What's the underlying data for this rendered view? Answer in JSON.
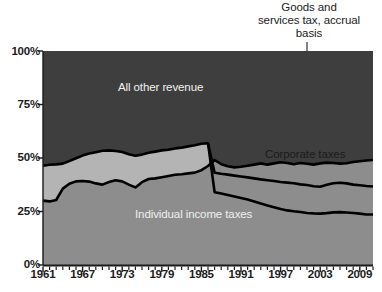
{
  "chart_data": {
    "type": "area",
    "stacked": true,
    "normalized_percent": true,
    "title": "",
    "subtitle": "",
    "xlabel": "",
    "ylabel": "",
    "xlim": [
      1961,
      2011
    ],
    "ylim": [
      0,
      100
    ],
    "grid": false,
    "legend_position": "inline-labels",
    "y_ticks": [
      "0%",
      "25%",
      "50%",
      "75%",
      "100%"
    ],
    "y_tick_values": [
      0,
      25,
      50,
      75,
      100
    ],
    "x_ticks": [
      "1961",
      "1967",
      "1973",
      "1979",
      "1985",
      "1991",
      "1997",
      "2003",
      "2009"
    ],
    "x_tick_values": [
      1961,
      1967,
      1973,
      1979,
      1985,
      1991,
      1997,
      2003,
      2009
    ],
    "x_minor_tick_interval": 1,
    "annotations": [
      {
        "name": "gst-annotation",
        "lines": [
          "Goods and",
          "services tax, accrual",
          "basis"
        ],
        "text": "Goods and services tax, accrual basis",
        "leader_line": true,
        "points_to_year": 2003
      }
    ],
    "series": [
      {
        "name": "Individual income taxes",
        "label": "Individual income taxes",
        "color": "#8d8d8d",
        "label_color": "#efefef",
        "stack_order": 1,
        "x": [
          1961,
          1962,
          1963,
          1964,
          1965,
          1966,
          1967,
          1968,
          1969,
          1970,
          1971,
          1972,
          1973,
          1974,
          1975,
          1976,
          1977,
          1978,
          1979,
          1980,
          1981,
          1982,
          1983,
          1984,
          1985,
          1986,
          1987,
          1988,
          1989,
          1990,
          1991,
          1992,
          1993,
          1994,
          1995,
          1996,
          1997,
          1998,
          1999,
          2000,
          2001,
          2002,
          2003,
          2004,
          2005,
          2006,
          2007,
          2008,
          2009,
          2010,
          2011
        ],
        "values": [
          30.5,
          29.5,
          29.3,
          29.6,
          30.0,
          29.8,
          29.6,
          32.0,
          36.0,
          39.5,
          41.5,
          42.0,
          42.3,
          41.0,
          39.0,
          40.3,
          41.8,
          41.5,
          40.5,
          38.0,
          39.5,
          40.5,
          41.0,
          39.0,
          36.2,
          39.5,
          40.5,
          41.0,
          42.0,
          43.0,
          45.5,
          48.0,
          46.0,
          45.3,
          45.2,
          45.5,
          45.3,
          45.0,
          46.3,
          45.5,
          47.0,
          46.0,
          45.3,
          46.5,
          45.5,
          45.8,
          46.0,
          47.5,
          47.5,
          48.5,
          49.0
        ]
      },
      {
        "name": "Corporate taxes",
        "label": "Corporate taxes",
        "color": "#b4b4b4",
        "label_color": "#1b1b1b",
        "stack_order": 2,
        "x": [
          1961,
          1962,
          1963,
          1964,
          1965,
          1966,
          1967,
          1968,
          1969,
          1970,
          1971,
          1972,
          1973,
          1974,
          1975,
          1976,
          1977,
          1978,
          1979,
          1980,
          1981,
          1982,
          1983,
          1984,
          1985,
          1986,
          1987,
          1988,
          1989,
          1990,
          1991,
          1992,
          1993,
          1994,
          1995,
          1996,
          1997,
          1998,
          1999,
          2000,
          2001,
          2002,
          2003,
          2004,
          2005,
          2006,
          2007,
          2008,
          2009,
          2010,
          2011
        ],
        "values": [
          20.5,
          19.3,
          19.0,
          18.6,
          18.3,
          18.4,
          18.0,
          19.5,
          17.7,
          16.5,
          15.0,
          15.3,
          16.2,
          17.5,
          18.0,
          16.0,
          14.5,
          14.5,
          15.8,
          18.0,
          16.3,
          14.5,
          14.0,
          16.5,
          18.5,
          14.5,
          14.0,
          14.5,
          13.8,
          13.0,
          11.5,
          6.0,
          7.3,
          8.5,
          9.0,
          9.5,
          10.5,
          11.5,
          11.3,
          13.0,
          12.8,
          13.5,
          12.5,
          12.2,
          14.5,
          15.5,
          15.2,
          13.5,
          13.0,
          13.3,
          13.2
        ]
      },
      {
        "name": "Goods and services tax, accrual basis",
        "label": "",
        "color": "#e7e7e7",
        "stack_order": 3,
        "note": "Band appears beginning 1991; zero before that.",
        "x": [
          1961,
          1962,
          1963,
          1964,
          1965,
          1966,
          1967,
          1968,
          1969,
          1970,
          1971,
          1972,
          1973,
          1974,
          1975,
          1976,
          1977,
          1978,
          1979,
          1980,
          1981,
          1982,
          1983,
          1984,
          1985,
          1986,
          1987,
          1988,
          1989,
          1990,
          1991,
          1992,
          1993,
          1994,
          1995,
          1996,
          1997,
          1998,
          1999,
          2000,
          2001,
          2002,
          2003,
          2004,
          2005,
          2006,
          2007,
          2008,
          2009,
          2010,
          2011
        ],
        "values": [
          0,
          0,
          0,
          0,
          0,
          0,
          0,
          0,
          0,
          0,
          0,
          0,
          0,
          0,
          0,
          0,
          0,
          0,
          0,
          0,
          0,
          0,
          0,
          0,
          0,
          0,
          0,
          0,
          0,
          0,
          0,
          14.5,
          14.2,
          14.0,
          13.8,
          13.7,
          13.5,
          13.3,
          13.8,
          14.2,
          14.0,
          14.2,
          15.0,
          14.8,
          13.7,
          13.2,
          13.5,
          14.5,
          14.8,
          14.0,
          13.8
        ]
      },
      {
        "name": "All other revenue",
        "label": "All other revenue",
        "color": "#3e3e3e",
        "label_color": "#f2f2f2",
        "stack_order": 4,
        "x": [
          1961,
          1962,
          1963,
          1964,
          1965,
          1966,
          1967,
          1968,
          1969,
          1970,
          1971,
          1972,
          1973,
          1974,
          1975,
          1976,
          1977,
          1978,
          1979,
          1980,
          1981,
          1982,
          1983,
          1984,
          1985,
          1986,
          1987,
          1988,
          1989,
          1990,
          1991,
          1992,
          1993,
          1994,
          1995,
          1996,
          1997,
          1998,
          1999,
          2000,
          2001,
          2002,
          2003,
          2004,
          2005,
          2006,
          2007,
          2008,
          2009,
          2010,
          2011
        ],
        "values": [
          49.0,
          51.2,
          51.7,
          51.8,
          51.7,
          51.8,
          52.4,
          48.5,
          46.3,
          44.0,
          43.5,
          42.7,
          41.5,
          41.5,
          43.0,
          43.7,
          43.7,
          44.0,
          43.7,
          44.0,
          44.2,
          45.0,
          45.0,
          44.5,
          45.3,
          46.0,
          45.5,
          44.5,
          44.2,
          44.0,
          43.0,
          31.5,
          32.5,
          32.2,
          32.0,
          31.3,
          30.7,
          30.2,
          28.6,
          27.3,
          26.2,
          26.3,
          27.2,
          26.5,
          26.3,
          25.5,
          25.3,
          24.5,
          24.7,
          24.2,
          24.0
        ]
      }
    ]
  },
  "axis": {
    "y_labels": [
      "100%",
      "75%",
      "50%",
      "25%",
      "0%"
    ],
    "x_labels": [
      "1961",
      "1967",
      "1973",
      "1979",
      "1985",
      "1991",
      "1997",
      "2003",
      "2009"
    ]
  },
  "annotation": {
    "line1": "Goods and",
    "line2": "services tax, accrual",
    "line3": "basis"
  },
  "labels": {
    "all_other_revenue": "All other revenue",
    "corporate_taxes": "Corporate taxes",
    "individual_income_taxes": "Individual income taxes"
  },
  "caption": {
    "text": ""
  },
  "colors": {
    "all_other_revenue": "#3e3e3e",
    "gst": "#e7e7e7",
    "corporate_taxes": "#b4b4b4",
    "individual_income_taxes": "#8d8d8d",
    "outline": "#000000",
    "text": "#1b1b1b",
    "background": "#ffffff"
  }
}
